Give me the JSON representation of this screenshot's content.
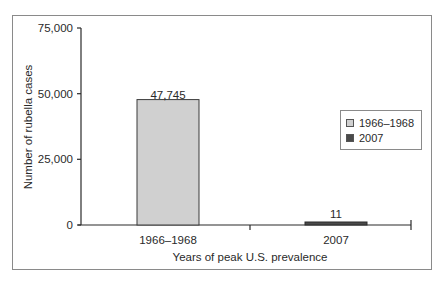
{
  "chart_data": {
    "type": "bar",
    "title": "",
    "xlabel": "Years of peak U.S. prevalence",
    "ylabel": "Number of rubella cases",
    "categories": [
      "1966–1968",
      "2007"
    ],
    "values": [
      47745,
      11
    ],
    "data_labels": [
      "47,745",
      "11"
    ],
    "ylim": [
      0,
      75000
    ],
    "yticks": [
      0,
      25000,
      50000,
      75000
    ],
    "ytick_labels": [
      "0",
      "25,000",
      "50,000",
      "75,000"
    ],
    "grid": false,
    "legend": {
      "position": "right",
      "entries": [
        {
          "label": "1966–1968",
          "color": "#d0d0d0"
        },
        {
          "label": "2007",
          "color": "#4a4a4a"
        }
      ]
    },
    "colors": [
      "#d0d0d0",
      "#4a4a4a"
    ]
  }
}
